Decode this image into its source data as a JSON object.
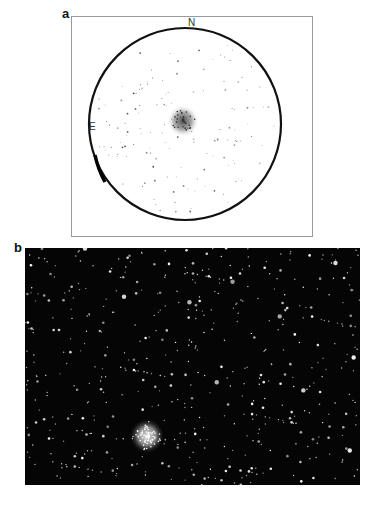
{
  "figure": {
    "panel_a": {
      "label": "a",
      "description": "Finder chart: sky field in circular field of view with star cluster at center",
      "compass": {
        "north": "N",
        "east": "E"
      }
    },
    "panel_b": {
      "label": "b",
      "description": "Photograph of star field with globular cluster lower-left of center"
    }
  }
}
